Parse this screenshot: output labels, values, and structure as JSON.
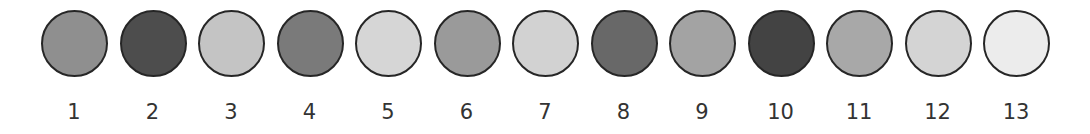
{
  "swatches": [
    {
      "label": "1",
      "color": "#8f8f8f"
    },
    {
      "label": "2",
      "color": "#4d4d4d"
    },
    {
      "label": "3",
      "color": "#c4c4c4"
    },
    {
      "label": "4",
      "color": "#7a7a7a"
    },
    {
      "label": "5",
      "color": "#d6d6d6"
    },
    {
      "label": "6",
      "color": "#9a9a9a"
    },
    {
      "label": "7",
      "color": "#d2d2d2"
    },
    {
      "label": "8",
      "color": "#686868"
    },
    {
      "label": "9",
      "color": "#a3a3a3"
    },
    {
      "label": "10",
      "color": "#434343"
    },
    {
      "label": "11",
      "color": "#a8a8a8"
    },
    {
      "label": "12",
      "color": "#d4d4d4"
    },
    {
      "label": "13",
      "color": "#ececec"
    }
  ],
  "style": {
    "outline_color": "#262626",
    "label_color": "#333333",
    "background": "#ffffff"
  }
}
